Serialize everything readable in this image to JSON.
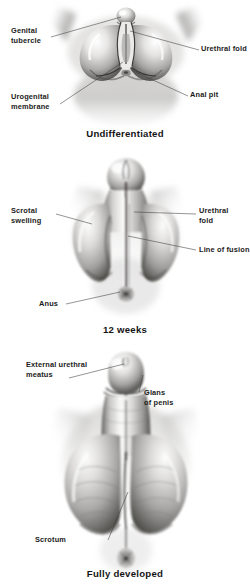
{
  "figure": {
    "style": {
      "background": "#ffffff",
      "ink": "#1b1b1b",
      "leader_line": "#3d3d3d",
      "tissue_light": "#f2f1f0",
      "tissue_mid": "#bdbcbb",
      "tissue_dark": "#6e6d6c",
      "tissue_shadow": "#3a3a3a"
    }
  },
  "panels": [
    {
      "id": "undifferentiated",
      "caption": "Undifferentiated",
      "labels": [
        {
          "name": "genital-tubercle",
          "text": "Genital\ntubercle",
          "align": "left"
        },
        {
          "name": "urethral-fold",
          "text": "Urethral fold",
          "align": "left"
        },
        {
          "name": "urogenital-membrane",
          "text": "Urogenital\nmembrane",
          "align": "left"
        },
        {
          "name": "anal-pit",
          "text": "Anal pit",
          "align": "left"
        }
      ]
    },
    {
      "id": "twelve-weeks",
      "caption": "12 weeks",
      "labels": [
        {
          "name": "scrotal-swelling",
          "text": "Scrotal\nswelling",
          "align": "left"
        },
        {
          "name": "urethral-fold",
          "text": "Urethral\nfold",
          "align": "left"
        },
        {
          "name": "line-of-fusion",
          "text": "Line of fusion",
          "align": "left"
        },
        {
          "name": "anus",
          "text": "Anus",
          "align": "left"
        }
      ]
    },
    {
      "id": "fully-developed",
      "caption": "Fully developed",
      "labels": [
        {
          "name": "external-urethral-meatus",
          "text": "External urethral\nmeatus",
          "align": "left"
        },
        {
          "name": "glans-of-penis",
          "text": "Glans\nof penis",
          "align": "left"
        },
        {
          "name": "scrotum",
          "text": "Scrotum",
          "align": "left"
        }
      ]
    }
  ]
}
